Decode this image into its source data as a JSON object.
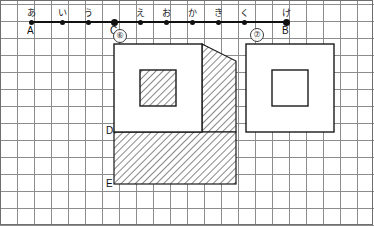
{
  "canvas": {
    "width": 374,
    "height": 226,
    "background": "#ffffff"
  },
  "grid": {
    "cell": 17,
    "minor_color": "#b9b9b9",
    "major_color": "#8d8d8d",
    "border_color": "#6f6f6f",
    "major_every": 1
  },
  "number_line": {
    "name": "number-line",
    "y": 21,
    "x_start": 31,
    "x_end": 286,
    "color": "#111111",
    "ticks": [
      {
        "kana": "あ",
        "x": 31,
        "point": "A",
        "emphasis": false
      },
      {
        "kana": "い",
        "x": 62,
        "point": "",
        "emphasis": false
      },
      {
        "kana": "う",
        "x": 88,
        "point": "",
        "emphasis": false
      },
      {
        "kana": "",
        "x": 114,
        "point": "C",
        "emphasis": true
      },
      {
        "kana": "え",
        "x": 140,
        "point": "",
        "emphasis": false
      },
      {
        "kana": "お",
        "x": 166,
        "point": "",
        "emphasis": false
      },
      {
        "kana": "か",
        "x": 192,
        "point": "",
        "emphasis": false
      },
      {
        "kana": "き",
        "x": 218,
        "point": "",
        "emphasis": false
      },
      {
        "kana": "く",
        "x": 244,
        "point": "",
        "emphasis": false
      },
      {
        "kana": "け",
        "x": 286,
        "point": "B",
        "emphasis": true
      }
    ]
  },
  "labels": {
    "left_figure_badge": "⑥",
    "right_figure_badge": "⑦",
    "point_A": "A",
    "point_B": "B",
    "point_C": "C",
    "point_D": "D",
    "point_E": "E"
  },
  "figures": {
    "left": {
      "name": "figure-6",
      "badge": "⑥",
      "badge_x": 113,
      "badge_y": 29,
      "outer_square": {
        "x": 114,
        "y": 44,
        "w": 88,
        "h": 88,
        "fill": "#ffffff",
        "stroke": "#1a1a1a"
      },
      "inner_square": {
        "x": 140,
        "y": 70,
        "w": 36,
        "h": 36,
        "fill": "hatch",
        "stroke": "#1a1a1a"
      },
      "lower_hatch_rect": {
        "x": 114,
        "y": 132,
        "w": 122,
        "h": 52,
        "fill": "hatch",
        "stroke": "#1a1a1a"
      },
      "right_hatch_trapezoid": {
        "points": "202,44 236,61 236,132 202,132",
        "fill": "hatch",
        "stroke": "#1a1a1a"
      },
      "label_D": {
        "text": "D",
        "x": 106,
        "y": 126
      },
      "label_E": {
        "text": "E",
        "x": 106,
        "y": 179
      }
    },
    "right": {
      "name": "figure-7",
      "badge": "⑦",
      "badge_x": 250,
      "badge_y": 28,
      "outer_square": {
        "x": 246,
        "y": 44,
        "w": 88,
        "h": 88,
        "fill": "#ffffff",
        "stroke": "#1a1a1a"
      },
      "inner_square": {
        "x": 272,
        "y": 70,
        "w": 36,
        "h": 36,
        "fill": "#ffffff",
        "stroke": "#1a1a1a"
      }
    }
  },
  "colors": {
    "ink": "#1a1a1a",
    "hatch_line": "#555555",
    "grid_minor": "#b9b9b9",
    "grid_major": "#8d8d8d"
  }
}
